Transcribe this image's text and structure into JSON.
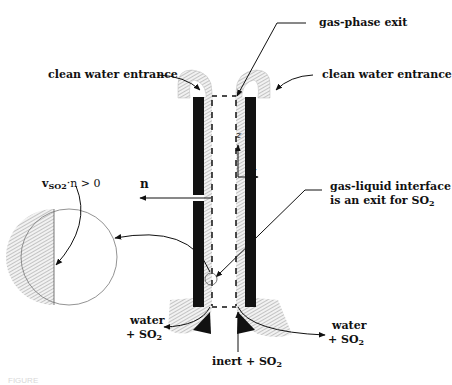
{
  "labels": {
    "gas_phase_exit": "gas-phase  exit",
    "clean_water_left": "clean water entrance",
    "clean_water_right": "clean water entrance",
    "axis_z": "z",
    "axis_r": "r",
    "normal_n": "n",
    "flux_condition_prefix": "v",
    "flux_condition_sub": "SO2",
    "flux_condition_suffix": "·n > 0",
    "interface_line1": "gas-liquid interface",
    "interface_line2_prefix": "is an exit for SO",
    "interface_line2_sub": "2",
    "water_left_line1": "water",
    "water_left_line2_prefix": "+ SO",
    "water_left_line2_sub": "2",
    "water_right_line1": "water",
    "water_right_line2_prefix": "+ SO",
    "water_right_line2_sub": "2",
    "inlet_prefix": "inert + SO",
    "inlet_sub": "2"
  },
  "caption": "FIGURE",
  "colors": {
    "ink": "#111111",
    "hatch": "#9a9a9a",
    "background": "#ffffff"
  }
}
